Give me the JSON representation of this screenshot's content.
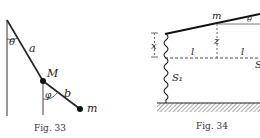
{
  "figures": [
    {
      "caption": "Fig. 33",
      "labels": {
        "theta": "θ",
        "a": "a",
        "M": "M",
        "phi": "φ",
        "b": "b",
        "m": "m"
      }
    },
    {
      "caption": "Fig. 34",
      "labels": {
        "m": "m",
        "theta": "θ",
        "x": "x",
        "z": "z",
        "l_left": "l",
        "l_right": "l",
        "S1": "S₁",
        "S_right": "S"
      }
    }
  ]
}
